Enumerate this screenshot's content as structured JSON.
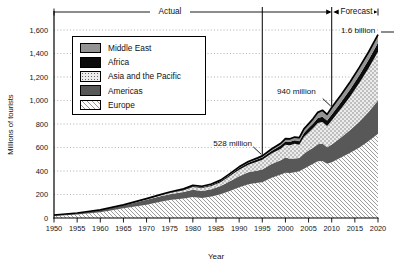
{
  "chart_data": {
    "type": "area",
    "stacked": true,
    "xlabel": "Year",
    "ylabel": "Millions of tourists",
    "x_range": [
      1950,
      2020
    ],
    "y_range": [
      0,
      1600
    ],
    "grid": "horizontal-dotted",
    "legend_position": "top-left",
    "x_ticks": [
      1950,
      1955,
      1960,
      1965,
      1970,
      1975,
      1980,
      1985,
      1990,
      1995,
      2000,
      2005,
      2010,
      2015,
      2020
    ],
    "y_ticks": [
      {
        "v": 0,
        "label": "0"
      },
      {
        "v": 200,
        "label": "200"
      },
      {
        "v": 400,
        "label": "400"
      },
      {
        "v": 600,
        "label": "600"
      },
      {
        "v": 800,
        "label": "800"
      },
      {
        "v": 1000,
        "label": "1,000"
      },
      {
        "v": 1200,
        "label": "1,200"
      },
      {
        "v": 1400,
        "label": "1,400"
      },
      {
        "v": 1600,
        "label": "1,600"
      }
    ],
    "years": [
      1950,
      1955,
      1960,
      1965,
      1970,
      1973,
      1975,
      1978,
      1980,
      1982,
      1984,
      1986,
      1988,
      1990,
      1992,
      1994,
      1995,
      1997,
      1999,
      2000,
      2001,
      2002,
      2003,
      2004,
      2005,
      2006,
      2007,
      2008,
      2009,
      2010,
      2012,
      2014,
      2016,
      2018,
      2020
    ],
    "series": [
      {
        "name": "Europe",
        "pattern": "hatch",
        "values": [
          17,
          30,
          50,
          84,
          113,
          139,
          153,
          167,
          178,
          170,
          182,
          202,
          230,
          262,
          287,
          300,
          304,
          343,
          370,
          386,
          383,
          390,
          397,
          420,
          441,
          462,
          484,
          485,
          461,
          475,
          515,
          555,
          600,
          655,
          717
        ]
      },
      {
        "name": "Americas",
        "pattern": "solid-dark",
        "values": [
          7.5,
          11,
          17,
          23,
          42,
          46,
          50,
          55,
          62,
          60,
          63,
          70,
          82,
          93,
          102,
          105,
          109,
          116,
          122,
          128,
          122,
          117,
          113,
          126,
          133,
          136,
          143,
          148,
          141,
          150,
          170,
          195,
          222,
          250,
          282
        ]
      },
      {
        "name": "Asia and the Pacific",
        "pattern": "dots",
        "values": [
          0.2,
          0.5,
          1,
          2,
          6,
          8,
          10,
          15,
          23,
          25,
          28,
          33,
          45,
          56,
          64,
          75,
          82,
          89,
          98,
          110,
          115,
          124,
          113,
          144,
          154,
          167,
          182,
          184,
          181,
          205,
          245,
          285,
          330,
          372,
          416
        ]
      },
      {
        "name": "Africa",
        "pattern": "solid-black",
        "values": [
          0.5,
          0.7,
          0.8,
          1.5,
          2.4,
          3.5,
          4.7,
          6,
          7.2,
          7.5,
          8.5,
          9.5,
          12,
          15,
          17,
          19,
          20,
          23,
          26,
          28,
          29,
          30,
          31,
          34,
          37,
          40,
          43,
          44,
          46,
          50,
          55,
          61,
          66,
          71,
          77
        ]
      },
      {
        "name": "Middle East",
        "pattern": "solid-gray",
        "values": [
          0.2,
          0.3,
          0.6,
          1.5,
          1.9,
          2.5,
          3.5,
          5,
          7.1,
          7.5,
          7.8,
          8,
          9,
          9.6,
          11,
          12.5,
          13.7,
          16,
          20,
          24,
          25,
          28,
          30,
          34,
          36,
          41,
          47,
          56,
          53,
          60,
          62,
          64,
          66,
          67,
          69
        ]
      }
    ],
    "annotations": [
      {
        "label": "528 million",
        "year": 1995,
        "value": 528,
        "marker_line": true,
        "leader": "diag"
      },
      {
        "label": "940 million",
        "year": 2010,
        "value": 940,
        "marker_line": true,
        "leader": "diag"
      },
      {
        "label": "1.6 billion",
        "year": 2020,
        "value": 1600,
        "marker_line": false,
        "leader": "dash"
      }
    ],
    "spans": [
      {
        "label": "Actual",
        "from": 1950,
        "to": 2010
      },
      {
        "label": "Forecast",
        "from": 2010,
        "to": 2020
      }
    ],
    "colors": {
      "europe_hatch_line": "#9b9b9b",
      "americas": "#585858",
      "asia_dots": "#6a6a6a",
      "asia_bg": "#ececec",
      "africa": "#0c0c0c",
      "middle_east": "#949494",
      "outline": "#000000",
      "grid": "#9a9a9a"
    }
  }
}
